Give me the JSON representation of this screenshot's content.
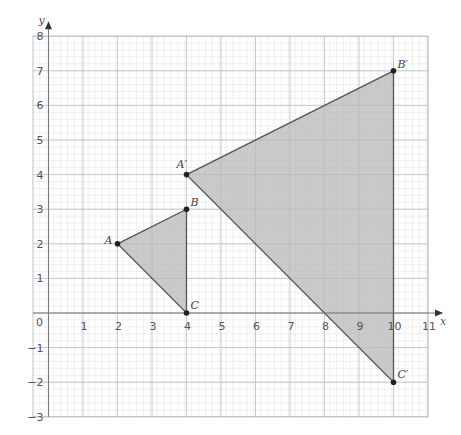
{
  "diagram": {
    "type": "coordinate-plane-dilation",
    "axes": {
      "x_label": "x",
      "y_label": "y",
      "x_range": [
        -1,
        11
      ],
      "y_range": [
        -3,
        8
      ],
      "x_ticks": [
        "1",
        "2",
        "3",
        "4",
        "5",
        "6",
        "7",
        "8",
        "9",
        "10",
        "11"
      ],
      "y_ticks": [
        "8",
        "7",
        "6",
        "5",
        "4",
        "3",
        "2",
        "1",
        "-1",
        "-2",
        "-3"
      ],
      "origin_label": "0",
      "minor_divisions": 5
    },
    "triangles": [
      {
        "name": "ABC",
        "vertices": [
          {
            "label": "A",
            "x": 2,
            "y": 2
          },
          {
            "label": "B",
            "x": 4,
            "y": 3
          },
          {
            "label": "C",
            "x": 4,
            "y": 0
          }
        ]
      },
      {
        "name": "A'B'C'",
        "vertices": [
          {
            "label": "A′",
            "x": 4,
            "y": 4
          },
          {
            "label": "B′",
            "x": 10,
            "y": 7
          },
          {
            "label": "C′",
            "x": 10,
            "y": -2
          }
        ]
      }
    ],
    "colors": {
      "fill": "#b8b8b8",
      "edge": "#555555",
      "major_grid": "#bdbdbd",
      "minor_grid": "#e6e6e6",
      "axis": "#777777"
    }
  }
}
